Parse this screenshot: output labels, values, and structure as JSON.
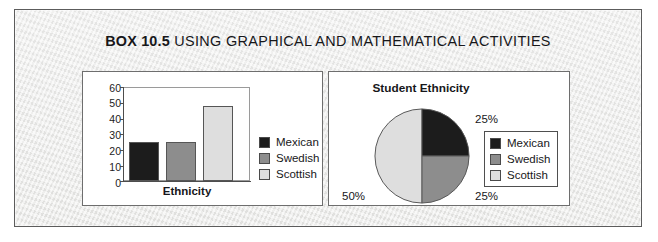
{
  "box": {
    "kicker": "BOX 10.5",
    "title": "USING GRAPHICAL AND MATHEMATICAL ACTIVITIES",
    "background_color": "#ececeb",
    "border_color": "#5c5c5c"
  },
  "colors": {
    "mexican": "#1c1c1c",
    "swedish": "#8d8d8d",
    "scottish": "#dedede",
    "outline": "#565656",
    "text": "#17171a"
  },
  "legend": {
    "items": [
      {
        "label": "Mexican",
        "color": "#1c1c1c"
      },
      {
        "label": "Swedish",
        "color": "#8d8d8d"
      },
      {
        "label": "Scottish",
        "color": "#dedede"
      }
    ]
  },
  "chart_data": [
    {
      "type": "bar",
      "title": "",
      "xlabel": "Ethnicity",
      "ylabel": "",
      "categories": [
        "Mexican",
        "Swedish",
        "Scottish"
      ],
      "values": [
        25,
        25,
        48
      ],
      "colors": [
        "#1c1c1c",
        "#8d8d8d",
        "#dedede"
      ],
      "ylim": [
        0,
        60
      ],
      "yticks": [
        0,
        10,
        20,
        30,
        40,
        50,
        60
      ],
      "ytick_labels": [
        "0",
        "10",
        "20",
        "30",
        "40",
        "50",
        "60"
      ],
      "grid": false,
      "legend_position": "right",
      "legend_entries": [
        "Mexican",
        "Swedish",
        "Scottish"
      ]
    },
    {
      "type": "pie",
      "title": "Student Ethnicity",
      "labels": [
        "Mexican",
        "Swedish",
        "Scottish"
      ],
      "values": [
        25,
        25,
        50
      ],
      "value_labels": [
        "25%",
        "25%",
        "50%"
      ],
      "colors": [
        "#1c1c1c",
        "#8d8d8d",
        "#dedede"
      ],
      "legend_position": "right",
      "legend_entries": [
        "Mexican",
        "Swedish",
        "Scottish"
      ]
    }
  ]
}
